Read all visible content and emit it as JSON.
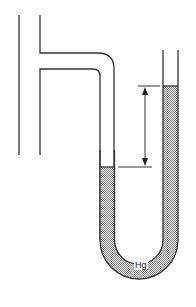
{
  "diagram": {
    "type": "U-tube mercury manometer connected to a pipe",
    "fluid_label": "Hg",
    "colors": {
      "line": "#333333",
      "mercury_fill": "#c8c8c8",
      "background": "#ffffff"
    },
    "annotations": {
      "height_difference_arrow": "double-headed arrow indicating height difference between mercury levels"
    }
  }
}
